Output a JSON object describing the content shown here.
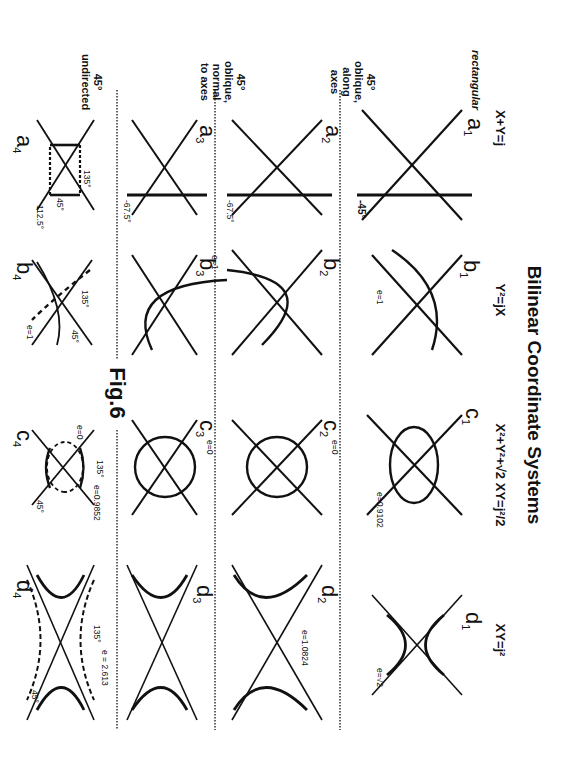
{
  "figure": {
    "title": "Bilinear Coordinate Systems",
    "caption": "Fig.6",
    "orientation": "rotated 90 degrees clockwise",
    "columns": [
      {
        "id": "a",
        "equation": "X+Y=j"
      },
      {
        "id": "b",
        "equation": "Y²=jX"
      },
      {
        "id": "c",
        "equation": "X²+Y²+√2 XY=j²/2"
      },
      {
        "id": "d",
        "equation": "XY=j²"
      }
    ],
    "rows": [
      {
        "id": "1",
        "label": [
          "rectangular"
        ]
      },
      {
        "id": "2",
        "label": [
          "45°",
          "oblique,",
          "along",
          "axes"
        ]
      },
      {
        "id": "3",
        "label": [
          "45°",
          "oblique,",
          "normal",
          "to axes"
        ]
      },
      {
        "id": "4",
        "label": [
          "45°",
          "undirected"
        ]
      }
    ],
    "panels": {
      "a1": {
        "letter": "a",
        "sub": "1",
        "angle": "-45°",
        "axes": [
          "-x",
          "-y",
          "+x",
          "+y"
        ]
      },
      "a2": {
        "letter": "a",
        "sub": "2",
        "angle": "-67.5°",
        "axes": [
          "-x",
          "-y",
          "+x",
          "+y"
        ]
      },
      "a3": {
        "letter": "a",
        "sub": "3",
        "angle": "-67.5°",
        "axes": [
          "-x",
          "-y",
          "+x",
          "+y"
        ]
      },
      "a4": {
        "letter": "a",
        "sub": "4",
        "angles": [
          "135°",
          "45°",
          "112.5°"
        ]
      },
      "b1": {
        "letter": "b",
        "sub": "1",
        "e": "e=1",
        "axes": [
          "-x",
          "-y",
          "+x",
          "+y"
        ]
      },
      "b2": {
        "letter": "b",
        "sub": "2",
        "axes": [
          "-x",
          "-y",
          "+x",
          "+y"
        ]
      },
      "b3": {
        "letter": "b",
        "sub": "3",
        "axes": [
          "-x",
          "-y",
          "+x",
          "+y"
        ]
      },
      "b23_e": "e=1",
      "b4": {
        "letter": "b",
        "sub": "4",
        "e": "e=1",
        "angles": [
          "135°",
          "45°"
        ]
      },
      "c1": {
        "letter": "c",
        "sub": "1",
        "e": "e=0.9102",
        "axes": [
          "-x",
          "-y",
          "+x",
          "+y"
        ]
      },
      "c2": {
        "letter": "c",
        "sub": "2",
        "e": "e=0",
        "axes": [
          "-x",
          "-y",
          "+x",
          "+y"
        ]
      },
      "c3": {
        "letter": "c",
        "sub": "3",
        "e": "e=0",
        "axes": [
          "-x",
          "-y",
          "+x",
          "+y"
        ]
      },
      "c4": {
        "letter": "c",
        "sub": "4",
        "e_inner": "e=0",
        "e_outer": "e=0.9852",
        "angles": [
          "135°",
          "45°"
        ]
      },
      "d1": {
        "letter": "d",
        "sub": "1",
        "e": "e=√2",
        "axes": [
          "-x",
          "-y",
          "+x",
          "+y"
        ]
      },
      "d2": {
        "letter": "d",
        "sub": "2",
        "e": "e=1.0824",
        "axes": [
          "-x",
          "-y",
          "+x",
          "+y"
        ]
      },
      "d3": {
        "letter": "d",
        "sub": "3",
        "axes": [
          "-x",
          "-y",
          "+x",
          "+y"
        ]
      },
      "d4": {
        "letter": "d",
        "sub": "4",
        "e": "e = 2.613",
        "angles": [
          "135°",
          "45°"
        ]
      }
    }
  }
}
